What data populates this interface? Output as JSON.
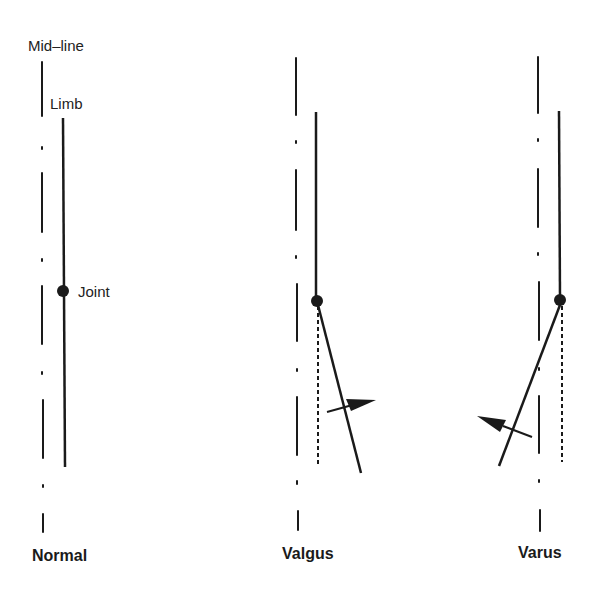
{
  "figure": {
    "annotations": {
      "midline": "Mid–line",
      "limb": "Limb",
      "joint": "Joint"
    },
    "panels": [
      {
        "id": "normal",
        "label": "Normal"
      },
      {
        "id": "valgus",
        "label": "Valgus"
      },
      {
        "id": "varus",
        "label": "Varus"
      }
    ],
    "caption_visible": false,
    "colors": {
      "ink": "#1a1a1a",
      "background": "#ffffff"
    }
  }
}
